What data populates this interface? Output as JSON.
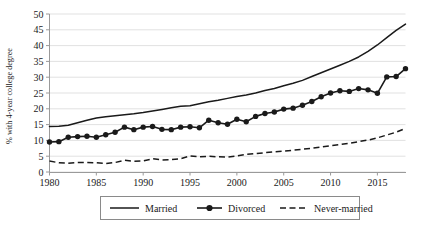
{
  "chart_data": {
    "type": "line",
    "title": "",
    "subtitle": "",
    "xlabel": "",
    "ylabel": "% with 4-year college degree",
    "xlim": [
      1980,
      2018
    ],
    "ylim": [
      0,
      50
    ],
    "yticks": [
      0,
      5,
      10,
      15,
      20,
      25,
      30,
      35,
      40,
      45,
      50
    ],
    "xticks": [
      1980,
      1985,
      1990,
      1995,
      2000,
      2005,
      2010,
      2015
    ],
    "xtick_labels": [
      "1980",
      "1985",
      "1990",
      "1995",
      "2000",
      "2005",
      "2010",
      "2015"
    ],
    "ytick_labels": [
      "0",
      "5",
      "10",
      "15",
      "20",
      "25",
      "30",
      "35",
      "40",
      "45",
      "50"
    ],
    "grid": "horizontal",
    "legend_position": "bottom-center",
    "x": [
      1980,
      1981,
      1982,
      1983,
      1984,
      1985,
      1986,
      1987,
      1988,
      1989,
      1990,
      1991,
      1992,
      1993,
      1994,
      1995,
      1996,
      1997,
      1998,
      1999,
      2000,
      2001,
      2002,
      2003,
      2004,
      2005,
      2006,
      2007,
      2008,
      2009,
      2010,
      2011,
      2012,
      2013,
      2014,
      2015,
      2016,
      2017,
      2018
    ],
    "series": [
      {
        "name": "Married",
        "style": "solid",
        "marker": "none",
        "color": "#1a1a1a",
        "values": [
          14.4,
          14.5,
          14.8,
          15.6,
          16.4,
          17.1,
          17.5,
          17.8,
          18.1,
          18.4,
          18.8,
          19.3,
          19.8,
          20.3,
          20.8,
          21.0,
          21.6,
          22.2,
          22.7,
          23.3,
          23.9,
          24.4,
          25.0,
          25.8,
          26.4,
          27.3,
          28.1,
          29.0,
          30.2,
          31.4,
          32.6,
          33.8,
          35.0,
          36.4,
          38.2,
          40.2,
          42.5,
          44.8,
          46.8
        ]
      },
      {
        "name": "Divorced",
        "style": "solid",
        "marker": "circle",
        "color": "#1a1a1a",
        "values": [
          9.5,
          9.6,
          11.0,
          11.2,
          11.3,
          11.0,
          11.8,
          12.6,
          14.2,
          13.4,
          14.2,
          14.4,
          13.5,
          13.4,
          14.2,
          14.3,
          14.0,
          16.4,
          15.6,
          15.1,
          16.7,
          15.9,
          17.6,
          18.5,
          19.0,
          19.9,
          20.2,
          21.1,
          22.3,
          23.8,
          25.0,
          25.7,
          25.5,
          26.4,
          26.0,
          24.9,
          30.1,
          30.2,
          32.7
        ]
      },
      {
        "name": "Never-married",
        "style": "dashed",
        "marker": "none",
        "color": "#1a1a1a",
        "values": [
          3.5,
          2.9,
          2.8,
          3.0,
          3.0,
          2.9,
          2.7,
          3.0,
          3.7,
          3.4,
          3.5,
          4.2,
          3.8,
          3.9,
          4.2,
          5.1,
          4.8,
          5.0,
          4.8,
          4.7,
          5.1,
          5.6,
          5.8,
          6.1,
          6.4,
          6.6,
          6.9,
          7.2,
          7.5,
          7.9,
          8.3,
          8.7,
          9.1,
          9.6,
          10.1,
          10.8,
          11.7,
          12.6,
          13.8
        ]
      }
    ],
    "legend_entries": [
      {
        "label": "Married",
        "style": "solid",
        "marker": "none"
      },
      {
        "label": "Divorced",
        "style": "solid",
        "marker": "circle"
      },
      {
        "label": "Never-married",
        "style": "dashed",
        "marker": "none"
      }
    ]
  },
  "axis": {
    "y_title": "% with 4-year college degree"
  },
  "legend": {
    "item_married": "Married",
    "item_divorced": "Divorced",
    "item_nevermarried": "Never-married"
  }
}
